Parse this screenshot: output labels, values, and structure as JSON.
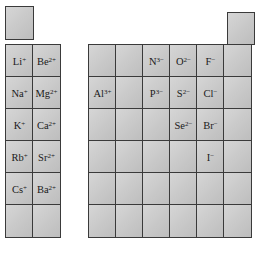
{
  "diagram": {
    "title": "",
    "left_block": {
      "top_cell": {
        "label": ""
      },
      "rows": [
        [
          {
            "sym": "Li",
            "charge": "+"
          },
          {
            "sym": "Be",
            "charge": "2+"
          }
        ],
        [
          {
            "sym": "Na",
            "charge": "+"
          },
          {
            "sym": "Mg",
            "charge": "2+"
          }
        ],
        [
          {
            "sym": "K",
            "charge": "+"
          },
          {
            "sym": "Ca",
            "charge": "2+"
          }
        ],
        [
          {
            "sym": "Rb",
            "charge": "+"
          },
          {
            "sym": "Sr",
            "charge": "2+"
          }
        ],
        [
          {
            "sym": "Cs",
            "charge": "+"
          },
          {
            "sym": "Ba",
            "charge": "2+"
          }
        ],
        [
          {
            "sym": "",
            "charge": ""
          },
          {
            "sym": "",
            "charge": ""
          }
        ]
      ]
    },
    "right_block": {
      "top_cell": {
        "label": ""
      },
      "rows": [
        [
          {
            "sym": "",
            "charge": ""
          },
          {
            "sym": "",
            "charge": ""
          },
          {
            "sym": "N",
            "charge": "3−"
          },
          {
            "sym": "O",
            "charge": "2−"
          },
          {
            "sym": "F",
            "charge": "−"
          },
          {
            "sym": "",
            "charge": ""
          }
        ],
        [
          {
            "sym": "Al",
            "charge": "3+"
          },
          {
            "sym": "",
            "charge": ""
          },
          {
            "sym": "P",
            "charge": "3−"
          },
          {
            "sym": "S",
            "charge": "2−"
          },
          {
            "sym": "Cl",
            "charge": "−"
          },
          {
            "sym": "",
            "charge": ""
          }
        ],
        [
          {
            "sym": "",
            "charge": ""
          },
          {
            "sym": "",
            "charge": ""
          },
          {
            "sym": "",
            "charge": ""
          },
          {
            "sym": "Se",
            "charge": "2−"
          },
          {
            "sym": "Br",
            "charge": "−"
          },
          {
            "sym": "",
            "charge": ""
          }
        ],
        [
          {
            "sym": "",
            "charge": ""
          },
          {
            "sym": "",
            "charge": ""
          },
          {
            "sym": "",
            "charge": ""
          },
          {
            "sym": "",
            "charge": ""
          },
          {
            "sym": "I",
            "charge": "−"
          },
          {
            "sym": "",
            "charge": ""
          }
        ],
        [
          {
            "sym": "",
            "charge": ""
          },
          {
            "sym": "",
            "charge": ""
          },
          {
            "sym": "",
            "charge": ""
          },
          {
            "sym": "",
            "charge": ""
          },
          {
            "sym": "",
            "charge": ""
          },
          {
            "sym": "",
            "charge": ""
          }
        ],
        [
          {
            "sym": "",
            "charge": ""
          },
          {
            "sym": "",
            "charge": ""
          },
          {
            "sym": "",
            "charge": ""
          },
          {
            "sym": "",
            "charge": ""
          },
          {
            "sym": "",
            "charge": ""
          },
          {
            "sym": "",
            "charge": ""
          }
        ]
      ]
    }
  }
}
